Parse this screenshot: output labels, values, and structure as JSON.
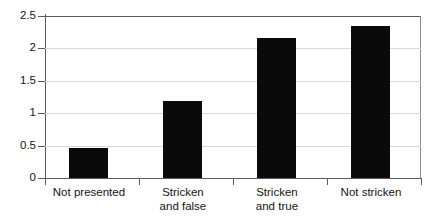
{
  "chart_data": {
    "type": "bar",
    "title": "",
    "subtitle": "",
    "xlabel": "",
    "ylabel": "",
    "categories": [
      "Not presented",
      "Stricken\nand false",
      "Stricken\nand true",
      "Not stricken"
    ],
    "values": [
      0.47,
      1.19,
      2.16,
      2.35
    ],
    "ylim": [
      0,
      2.5
    ],
    "yticks": [
      0,
      0.5,
      1,
      1.5,
      2,
      2.5
    ],
    "ytick_labels": [
      "0",
      "0.5",
      "1",
      "1.5",
      "2",
      "2.5"
    ],
    "grid": "horizontal",
    "legend": "none",
    "series": [
      {
        "name": "",
        "values": [
          0.47,
          1.19,
          2.16,
          2.35
        ]
      }
    ],
    "colors": {
      "bar": "#0a0a0a",
      "gridline": "#d8d8d8",
      "axis": "#5a5a5a",
      "text": "#141414",
      "background": "#ffffff"
    }
  }
}
